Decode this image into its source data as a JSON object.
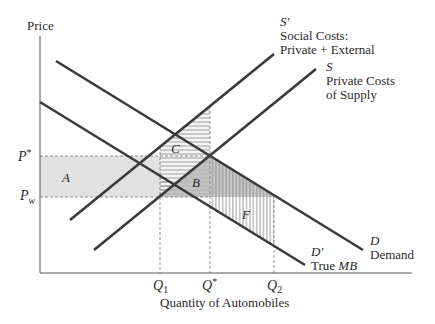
{
  "axes": {
    "y_label": "Price",
    "x_label": "Quantity of Automobiles"
  },
  "price_ticks": {
    "p_star": "P",
    "p_star_sup": "*",
    "p_w": "P",
    "p_w_sub": "w"
  },
  "quantity_ticks": {
    "q1": "Q",
    "q1_sub": "1",
    "q_star": "Q",
    "q_star_sup": "*",
    "q2": "Q",
    "q2_sub": "2"
  },
  "curves": {
    "s_prime": {
      "symbol": "S′",
      "line1": "Social Costs:",
      "line2": "Private + External"
    },
    "s": {
      "symbol": "S",
      "line1": "Private Costs",
      "line2": "of Supply"
    },
    "d": {
      "symbol": "D",
      "line1": "Demand"
    },
    "d_prime": {
      "symbol": "D′",
      "line1_prefix": "True ",
      "line1_ital": "MB"
    }
  },
  "areas": {
    "a": "A",
    "b": "B",
    "c": "C",
    "f": "F"
  },
  "colors": {
    "line": "#3a3a3a",
    "light_fill": "#e2e2e2",
    "dark_fill": "#b9b9b9",
    "hatch": "#8a8a8a",
    "dash": "#777777"
  }
}
